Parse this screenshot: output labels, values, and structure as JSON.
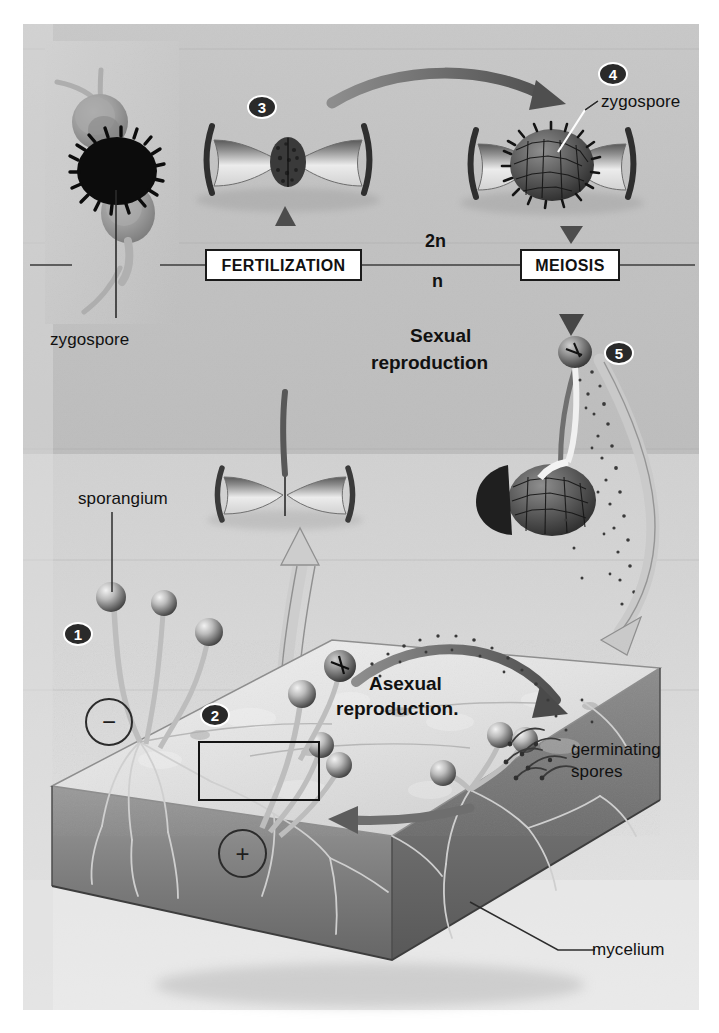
{
  "figure": {
    "background_color": "#c3c3c3",
    "paper_color": "#ffffff",
    "ink_color": "#1a1a1a"
  },
  "stage_boxes": [
    {
      "id": "fertilization",
      "label": "FERTILIZATION"
    },
    {
      "id": "meiosis",
      "label": "MEIOSIS"
    }
  ],
  "ploidy": {
    "diploid": "2n",
    "haploid": "n"
  },
  "headings": {
    "sexual_line1": "Sexual",
    "sexual_line2": "reproduction",
    "asexual_line1": "Asexual",
    "asexual_line2": "reproduction."
  },
  "steps": [
    {
      "number": "1",
      "x": 63,
      "y": 622
    },
    {
      "number": "2",
      "x": 200,
      "y": 703
    },
    {
      "number": "3",
      "x": 247,
      "y": 95
    },
    {
      "number": "4",
      "x": 598,
      "y": 62
    },
    {
      "number": "5",
      "x": 604,
      "y": 341
    }
  ],
  "mating_types": [
    {
      "symbol": "−",
      "name": "minus-mating-type",
      "x": 85,
      "y": 698,
      "size": 44
    },
    {
      "symbol": "+",
      "name": "plus-mating-type",
      "x": 218,
      "y": 829,
      "size": 45
    }
  ],
  "callouts": [
    {
      "id": "inset-zygospore",
      "label": "zygospore",
      "x": 50,
      "y": 330
    },
    {
      "id": "diagram-zygospore",
      "label": "zygospore",
      "x": 601,
      "y": 92
    },
    {
      "id": "sporangium",
      "label": "sporangium",
      "x": 78,
      "y": 489
    },
    {
      "id": "germinating-spores-line1",
      "label": "germinating",
      "x": 571,
      "y": 740
    },
    {
      "id": "germinating-spores-line2",
      "label": "spores",
      "x": 571,
      "y": 762
    },
    {
      "id": "mycelium",
      "label": "mycelium",
      "x": 592,
      "y": 952
    }
  ],
  "inset_photo": {
    "name": "zygospore-micrograph",
    "caption": "zygospore"
  }
}
